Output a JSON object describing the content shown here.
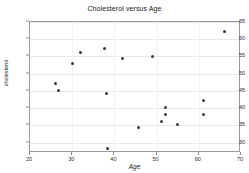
{
  "chart_data": {
    "type": "scatter",
    "title": "Cholesterol versus Age",
    "xlabel": "Age",
    "ylabel": "cholesterol",
    "xlim": [
      20,
      70
    ],
    "ylim": [
      27,
      65
    ],
    "xticks": [
      20,
      30,
      40,
      50,
      60,
      70
    ],
    "yticks": [
      30,
      35,
      40,
      45,
      50,
      55,
      60,
      65
    ],
    "grid": true,
    "legend": null,
    "series": [
      {
        "name": "patients",
        "marker": "filled-circle",
        "color": "#3a3a3a",
        "points": [
          {
            "x": 26.0,
            "y": 47.2
          },
          {
            "x": 26.8,
            "y": 45.1
          },
          {
            "x": 30.0,
            "y": 53.1
          },
          {
            "x": 32.0,
            "y": 56.1
          },
          {
            "x": 37.7,
            "y": 57.2
          },
          {
            "x": 38.2,
            "y": 44.4
          },
          {
            "x": 38.3,
            "y": 28.4
          },
          {
            "x": 42.0,
            "y": 54.3
          },
          {
            "x": 45.8,
            "y": 34.3
          },
          {
            "x": 49.0,
            "y": 55.1
          },
          {
            "x": 51.2,
            "y": 36.2
          },
          {
            "x": 52.0,
            "y": 40.1
          },
          {
            "x": 52.1,
            "y": 38.2
          },
          {
            "x": 55.0,
            "y": 35.2
          },
          {
            "x": 61.0,
            "y": 42.1
          },
          {
            "x": 61.1,
            "y": 38.2
          },
          {
            "x": 66.0,
            "y": 62.3
          }
        ]
      }
    ]
  }
}
